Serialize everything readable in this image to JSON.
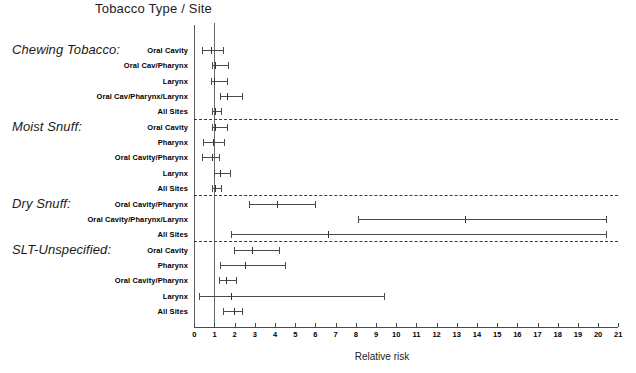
{
  "chart_data": {
    "type": "scatter",
    "title": "Tobacco Type / Site",
    "xlabel": "Relative risk",
    "ylabel": "",
    "xlim": [
      0,
      21
    ],
    "xticks": [
      0,
      1,
      2,
      3,
      4,
      5,
      6,
      7,
      8,
      9,
      10,
      11,
      12,
      13,
      14,
      15,
      16,
      17,
      18,
      19,
      20,
      21
    ],
    "xtick_labels": [
      "0",
      "1",
      "2",
      "3",
      "4",
      "5",
      "6",
      "7",
      "8",
      "9",
      "10",
      "11",
      "12",
      "13",
      "14",
      "15",
      "16",
      "17",
      "18",
      "19",
      "20",
      "21"
    ],
    "grid": false,
    "legend": false,
    "reference_line": 1,
    "groups": [
      {
        "label": "Chewing Tobacco:",
        "rows": [
          {
            "site": "Oral Cavity",
            "estimate": 0.84,
            "low": 0.38,
            "high": 1.4
          },
          {
            "site": "Oral Cav/Pharynx",
            "estimate": 1.05,
            "low": 0.88,
            "high": 1.65
          },
          {
            "site": "Larynx",
            "estimate": 1.0,
            "low": 0.85,
            "high": 1.6
          },
          {
            "site": "Oral Cav/Pharynx/Larynx",
            "estimate": 1.6,
            "low": 1.25,
            "high": 2.35
          },
          {
            "site": "All Sites",
            "estimate": 1.05,
            "low": 0.9,
            "high": 1.3
          }
        ]
      },
      {
        "label": "Moist Snuff:",
        "rows": [
          {
            "site": "Oral Cavity",
            "estimate": 1.05,
            "low": 0.88,
            "high": 1.6
          },
          {
            "site": "Pharynx",
            "estimate": 0.92,
            "low": 0.42,
            "high": 1.48
          },
          {
            "site": "Oral Cavity/Pharynx",
            "estimate": 0.88,
            "low": 0.4,
            "high": 1.2
          },
          {
            "site": "Larynx",
            "estimate": 1.25,
            "low": 0.99,
            "high": 1.77
          },
          {
            "site": "All Sites",
            "estimate": 1.05,
            "low": 0.9,
            "high": 1.32
          }
        ]
      },
      {
        "label": "Dry Snuff:",
        "rows": [
          {
            "site": "Oral Cavity/Pharynx",
            "estimate": 4.1,
            "low": 2.7,
            "high": 6.0
          },
          {
            "site": "Oral Cavity/Pharynx/Larynx",
            "estimate": 13.4,
            "low": 8.1,
            "high": 20.4
          },
          {
            "site": "All Sites",
            "estimate": 6.6,
            "low": 1.8,
            "high": 20.4
          }
        ]
      },
      {
        "label": "SLT-Unspecified:",
        "rows": [
          {
            "site": "Oral Cavity",
            "estimate": 2.85,
            "low": 1.98,
            "high": 4.2
          },
          {
            "site": "Pharynx",
            "estimate": 2.5,
            "low": 1.25,
            "high": 4.48
          },
          {
            "site": "Oral Cavity/Pharynx",
            "estimate": 1.58,
            "low": 1.22,
            "high": 2.08
          },
          {
            "site": "Larynx",
            "estimate": 1.8,
            "low": 0.25,
            "high": 9.38
          },
          {
            "site": "All Sites",
            "estimate": 1.95,
            "low": 1.42,
            "high": 2.38
          }
        ]
      }
    ]
  }
}
